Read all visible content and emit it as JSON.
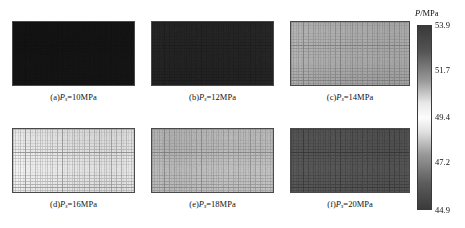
{
  "figure": {
    "type": "multi-panel-heatmap-figure",
    "background": "#ffffff",
    "width": 465,
    "height": 228
  },
  "colorbar": {
    "title": "P/MPa",
    "title_symbol": "P",
    "title_unit": "/MPa",
    "variable": "P",
    "unit": "MPa",
    "min": 44.9,
    "max": 53.9,
    "ticks": [
      53.9,
      51.7,
      49.4,
      47.2,
      44.9
    ],
    "tick_labels": [
      "53.9",
      "51.7",
      "49.4",
      "47.2",
      "44.9"
    ],
    "colormap": "grayscale-bipolar-light-center",
    "orientation": "vertical",
    "position": "right",
    "geometry": {
      "x": 417,
      "y": 25,
      "width": 15,
      "height": 185
    },
    "title_position": {
      "x": 415,
      "y": 8
    },
    "colors": {
      "top": "#3a3a3a",
      "upper_mid": "#9a9a9a",
      "center": "#fdfdfd",
      "lower_mid": "#9a9a9a",
      "bottom": "#3b3b3b"
    }
  },
  "panels": [
    {
      "id": "a",
      "caption_prefix": "(a)",
      "caption_symbol": "P",
      "caption_subscript": "s",
      "caption_suffix": "=10MPa",
      "caption_full": "(a)Ps=10MPa",
      "pressure_value": 10,
      "pressure_unit": "MPa",
      "mean_level": 45.4,
      "tone": "#141414",
      "grid_alpha": 0.1,
      "noise": 0.16,
      "geometry": {
        "x": 12,
        "y": 21,
        "width": 123,
        "height": 65
      },
      "caption_y": 92
    },
    {
      "id": "b",
      "caption_prefix": "(b)",
      "caption_symbol": "P",
      "caption_subscript": "s",
      "caption_suffix": "=12MPa",
      "caption_full": "(b)Ps=12MPa",
      "pressure_value": 12,
      "pressure_unit": "MPa",
      "mean_level": 45.9,
      "tone": "#242424",
      "grid_alpha": 0.14,
      "noise": 0.14,
      "geometry": {
        "x": 151,
        "y": 21,
        "width": 123,
        "height": 65
      },
      "caption_y": 92
    },
    {
      "id": "c",
      "caption_prefix": "(c)",
      "caption_symbol": "P",
      "caption_subscript": "s",
      "caption_suffix": "=14MPa",
      "caption_full": "(c)Ps=14MPa",
      "pressure_value": 14,
      "pressure_unit": "MPa",
      "mean_level": 49.6,
      "tone": "#a8a8a8",
      "grid_alpha": 0.3,
      "noise": 0.05,
      "geometry": {
        "x": 290,
        "y": 21,
        "width": 120,
        "height": 65
      },
      "caption_y": 92
    },
    {
      "id": "d",
      "caption_prefix": "(d)",
      "caption_symbol": "P",
      "caption_subscript": "s",
      "caption_suffix": "=16MPa",
      "caption_full": "(d)Ps=16MPa",
      "pressure_value": 16,
      "pressure_unit": "MPa",
      "mean_level": 51.3,
      "tone": "#e2e2e2",
      "grid_alpha": 0.34,
      "noise": 0.035,
      "geometry": {
        "x": 12,
        "y": 128,
        "width": 123,
        "height": 65
      },
      "caption_y": 199
    },
    {
      "id": "e",
      "caption_prefix": "(e)",
      "caption_symbol": "P",
      "caption_subscript": "s",
      "caption_suffix": "=18MPa",
      "caption_full": "(e)Ps=18MPa",
      "pressure_value": 18,
      "pressure_unit": "MPa",
      "mean_level": 50.2,
      "tone": "#b8b8b8",
      "grid_alpha": 0.3,
      "noise": 0.06,
      "geometry": {
        "x": 151,
        "y": 128,
        "width": 123,
        "height": 65
      },
      "caption_y": 199
    },
    {
      "id": "f",
      "caption_prefix": "(f)",
      "caption_symbol": "P",
      "caption_subscript": "s",
      "caption_suffix": "=20MPa",
      "caption_full": "(f)Ps=20MPa",
      "pressure_value": 20,
      "pressure_unit": "MPa",
      "mean_level": 47.4,
      "tone": "#535353",
      "grid_alpha": 0.22,
      "noise": 0.09,
      "geometry": {
        "x": 290,
        "y": 128,
        "width": 120,
        "height": 65
      },
      "caption_y": 199
    }
  ],
  "chart_data": {
    "type": "heatmap",
    "title": "",
    "subtitle": "",
    "xlabel": "",
    "ylabel": "",
    "colorbar_label": "P/MPa",
    "colorbar_range": [
      44.9,
      53.9
    ],
    "colorbar_ticks": [
      44.9,
      47.2,
      49.4,
      51.7,
      53.9
    ],
    "colormap": "grayscale (dark low / light mid / dark high)",
    "grid": true,
    "legend": "colorbar-right",
    "panel_layout": {
      "rows": 2,
      "cols": 3
    },
    "categories": [
      "(a)Ps=10MPa",
      "(b)Ps=12MPa",
      "(c)Ps=14MPa",
      "(d)Ps=16MPa",
      "(e)Ps=18MPa",
      "(f)Ps=20MPa"
    ],
    "series": [
      {
        "name": "inlet pressure Ps (MPa)",
        "values": [
          10,
          12,
          14,
          16,
          18,
          20
        ]
      },
      {
        "name": "mean field pressure P (MPa)",
        "values": [
          45.4,
          45.9,
          49.6,
          51.3,
          50.2,
          47.4
        ]
      }
    ],
    "annotations": [
      "Panel (a) field near colorbar minimum (~45 MPa), rendered near-black",
      "Panel (b) slightly above (a), still dark (~46 MPa)",
      "Panel (c) mid-gray mesh field (~49.5 MPa)",
      "Panel (d) lightest field, near colorbar light center (~51.3 MPa)",
      "Panel (e) light-to-mid gray field (~50 MPa)",
      "Panel (f) mid-dark gray field (~47.4 MPa)"
    ]
  }
}
